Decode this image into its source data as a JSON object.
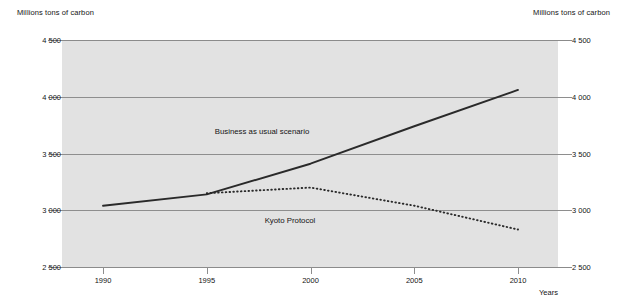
{
  "axis_unit_label_left": "Millions tons of carbon",
  "axis_unit_label_right": "Millions tons of carbon",
  "years_axis_label": "Years",
  "chart_data": {
    "type": "line",
    "title": "",
    "subtitle": "",
    "xlabel": "Years",
    "ylabel": "Millions tons of carbon",
    "ylabel_right": "Millions tons of carbon",
    "xlim": [
      1990,
      2010
    ],
    "ylim": [
      2500,
      4500
    ],
    "yticks": [
      2500,
      3000,
      3500,
      4000,
      4500
    ],
    "ytick_labels": [
      "2 500",
      "3 000",
      "3 500",
      "4 000",
      "4 500"
    ],
    "xticks": [
      1990,
      1995,
      2000,
      2005,
      2010
    ],
    "xtick_labels": [
      "1990",
      "1995",
      "2000",
      "2005",
      "2010"
    ],
    "grid": true,
    "grid_axis": "y",
    "legend": "inline-annotations",
    "legend_position": "inside-plot",
    "plot_background": "#e2e2e2",
    "line_color": "#2a2a2a",
    "series": [
      {
        "name": "Business as usual scenario",
        "style": "solid",
        "annotation": "Business as usual scenario",
        "x": [
          1990,
          1995,
          2000,
          2005,
          2010
        ],
        "values": [
          3040,
          3140,
          3410,
          3740,
          4060
        ]
      },
      {
        "name": "Kyoto Protocol",
        "style": "dotted",
        "annotation": "Kyoto Protocol",
        "x": [
          1995,
          2000,
          2005,
          2010
        ],
        "values": [
          3150,
          3200,
          3040,
          2830
        ]
      }
    ]
  }
}
